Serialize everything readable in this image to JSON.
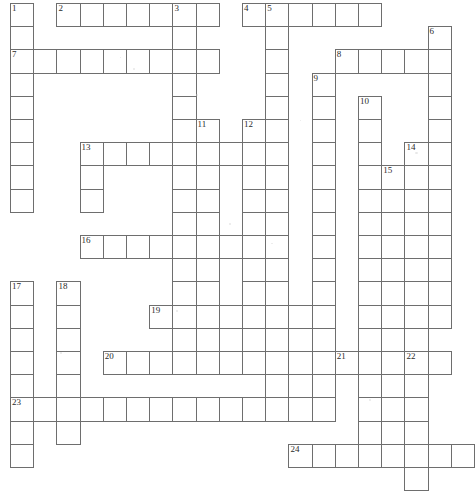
{
  "puzzle": {
    "kind": "crossword-grid",
    "title": "",
    "grid": {
      "origin_x": 10,
      "origin_y": 3,
      "cell_size": 23.2,
      "columns": 19,
      "rows": 20,
      "line_color": "#6e6e6e",
      "cell_color": "#ffffff",
      "number_color": "#2b2b2b"
    },
    "entries": [
      {
        "number": "1",
        "direction": "down",
        "col": 0,
        "row": 0,
        "length": 9
      },
      {
        "number": "2",
        "direction": "across",
        "col": 2,
        "row": 0,
        "length": 7
      },
      {
        "number": "3",
        "direction": "down",
        "col": 7,
        "row": 0,
        "length": 16
      },
      {
        "number": "4",
        "direction": "across",
        "col": 10,
        "row": 0,
        "length": 6
      },
      {
        "number": "5",
        "direction": "down",
        "col": 11,
        "row": 0,
        "length": 18
      },
      {
        "number": "6",
        "direction": "down",
        "col": 18,
        "row": 1,
        "length": 13
      },
      {
        "number": "7",
        "direction": "across",
        "col": 0,
        "row": 2,
        "length": 9
      },
      {
        "number": "8",
        "direction": "across",
        "col": 14,
        "row": 2,
        "length": 5
      },
      {
        "number": "9",
        "direction": "down",
        "col": 13,
        "row": 3,
        "length": 15
      },
      {
        "number": "10",
        "direction": "down",
        "col": 15,
        "row": 4,
        "length": 15
      },
      {
        "number": "11",
        "direction": "down",
        "col": 8,
        "row": 5,
        "length": 10
      },
      {
        "number": "12",
        "direction": "down",
        "col": 10,
        "row": 5,
        "length": 10
      },
      {
        "number": "13",
        "direction": "across",
        "col": 3,
        "row": 6,
        "length": 7
      },
      {
        "number": "14",
        "direction": "down",
        "col": 17,
        "row": 6,
        "length": 10
      },
      {
        "number": "15",
        "direction": "down",
        "col": 16,
        "row": 7,
        "length": 11
      },
      {
        "number": "16",
        "direction": "across",
        "col": 3,
        "row": 10,
        "length": 7
      },
      {
        "number": "17",
        "direction": "down",
        "col": 0,
        "row": 12,
        "length": 8
      },
      {
        "number": "18",
        "direction": "down",
        "col": 2,
        "row": 12,
        "length": 7
      },
      {
        "number": "19",
        "direction": "across",
        "col": 6,
        "row": 13,
        "length": 7
      },
      {
        "number": "20",
        "direction": "across",
        "col": 4,
        "row": 15,
        "length": 10
      },
      {
        "number": "21",
        "direction": "across",
        "col": 14,
        "row": 15,
        "length": 5
      },
      {
        "number": "22",
        "direction": "down",
        "col": 17,
        "row": 15,
        "length": 5
      },
      {
        "number": "23",
        "direction": "across",
        "col": 0,
        "row": 17,
        "length": 13
      },
      {
        "number": "24",
        "direction": "across",
        "col": 12,
        "row": 19,
        "length": 8
      }
    ],
    "cells": [
      {
        "col": 0,
        "row": 0,
        "num": "1"
      },
      {
        "col": 0,
        "row": 1,
        "num": ""
      },
      {
        "col": 0,
        "row": 2,
        "num": "7"
      },
      {
        "col": 0,
        "row": 3,
        "num": ""
      },
      {
        "col": 0,
        "row": 4,
        "num": ""
      },
      {
        "col": 0,
        "row": 5,
        "num": ""
      },
      {
        "col": 0,
        "row": 6,
        "num": ""
      },
      {
        "col": 0,
        "row": 7,
        "num": ""
      },
      {
        "col": 0,
        "row": 8,
        "num": ""
      },
      {
        "col": 1,
        "row": 2,
        "num": ""
      },
      {
        "col": 2,
        "row": 2,
        "num": ""
      },
      {
        "col": 3,
        "row": 2,
        "num": ""
      },
      {
        "col": 4,
        "row": 2,
        "num": ""
      },
      {
        "col": 5,
        "row": 2,
        "num": ""
      },
      {
        "col": 6,
        "row": 2,
        "num": ""
      },
      {
        "col": 7,
        "row": 2,
        "num": ""
      },
      {
        "col": 8,
        "row": 2,
        "num": ""
      },
      {
        "col": 2,
        "row": 0,
        "num": "2"
      },
      {
        "col": 3,
        "row": 0,
        "num": ""
      },
      {
        "col": 4,
        "row": 0,
        "num": ""
      },
      {
        "col": 5,
        "row": 0,
        "num": ""
      },
      {
        "col": 6,
        "row": 0,
        "num": ""
      },
      {
        "col": 7,
        "row": 0,
        "num": "3"
      },
      {
        "col": 8,
        "row": 0,
        "num": ""
      },
      {
        "col": 7,
        "row": 1,
        "num": ""
      },
      {
        "col": 7,
        "row": 3,
        "num": ""
      },
      {
        "col": 7,
        "row": 4,
        "num": ""
      },
      {
        "col": 7,
        "row": 5,
        "num": ""
      },
      {
        "col": 7,
        "row": 6,
        "num": ""
      },
      {
        "col": 7,
        "row": 7,
        "num": ""
      },
      {
        "col": 7,
        "row": 8,
        "num": ""
      },
      {
        "col": 7,
        "row": 9,
        "num": ""
      },
      {
        "col": 7,
        "row": 10,
        "num": ""
      },
      {
        "col": 7,
        "row": 11,
        "num": ""
      },
      {
        "col": 7,
        "row": 12,
        "num": ""
      },
      {
        "col": 7,
        "row": 13,
        "num": ""
      },
      {
        "col": 7,
        "row": 14,
        "num": ""
      },
      {
        "col": 7,
        "row": 15,
        "num": ""
      },
      {
        "col": 10,
        "row": 0,
        "num": "4"
      },
      {
        "col": 11,
        "row": 0,
        "num": "5"
      },
      {
        "col": 12,
        "row": 0,
        "num": ""
      },
      {
        "col": 13,
        "row": 0,
        "num": ""
      },
      {
        "col": 14,
        "row": 0,
        "num": ""
      },
      {
        "col": 15,
        "row": 0,
        "num": ""
      },
      {
        "col": 11,
        "row": 1,
        "num": ""
      },
      {
        "col": 11,
        "row": 2,
        "num": ""
      },
      {
        "col": 11,
        "row": 3,
        "num": ""
      },
      {
        "col": 11,
        "row": 4,
        "num": ""
      },
      {
        "col": 11,
        "row": 5,
        "num": ""
      },
      {
        "col": 11,
        "row": 6,
        "num": ""
      },
      {
        "col": 11,
        "row": 7,
        "num": ""
      },
      {
        "col": 11,
        "row": 8,
        "num": ""
      },
      {
        "col": 11,
        "row": 9,
        "num": ""
      },
      {
        "col": 11,
        "row": 10,
        "num": ""
      },
      {
        "col": 11,
        "row": 11,
        "num": ""
      },
      {
        "col": 11,
        "row": 12,
        "num": ""
      },
      {
        "col": 11,
        "row": 13,
        "num": ""
      },
      {
        "col": 11,
        "row": 14,
        "num": ""
      },
      {
        "col": 11,
        "row": 15,
        "num": ""
      },
      {
        "col": 11,
        "row": 16,
        "num": ""
      },
      {
        "col": 11,
        "row": 17,
        "num": ""
      },
      {
        "col": 18,
        "row": 1,
        "num": "6"
      },
      {
        "col": 18,
        "row": 2,
        "num": ""
      },
      {
        "col": 18,
        "row": 3,
        "num": ""
      },
      {
        "col": 18,
        "row": 4,
        "num": ""
      },
      {
        "col": 18,
        "row": 5,
        "num": ""
      },
      {
        "col": 18,
        "row": 6,
        "num": ""
      },
      {
        "col": 18,
        "row": 7,
        "num": ""
      },
      {
        "col": 18,
        "row": 8,
        "num": ""
      },
      {
        "col": 18,
        "row": 9,
        "num": ""
      },
      {
        "col": 18,
        "row": 10,
        "num": ""
      },
      {
        "col": 18,
        "row": 11,
        "num": ""
      },
      {
        "col": 18,
        "row": 12,
        "num": ""
      },
      {
        "col": 14,
        "row": 2,
        "num": "8"
      },
      {
        "col": 15,
        "row": 2,
        "num": ""
      },
      {
        "col": 16,
        "row": 2,
        "num": ""
      },
      {
        "col": 17,
        "row": 2,
        "num": ""
      },
      {
        "col": 13,
        "row": 3,
        "num": "9"
      },
      {
        "col": 13,
        "row": 4,
        "num": ""
      },
      {
        "col": 13,
        "row": 5,
        "num": ""
      },
      {
        "col": 13,
        "row": 6,
        "num": ""
      },
      {
        "col": 13,
        "row": 7,
        "num": ""
      },
      {
        "col": 13,
        "row": 8,
        "num": ""
      },
      {
        "col": 13,
        "row": 9,
        "num": ""
      },
      {
        "col": 13,
        "row": 10,
        "num": ""
      },
      {
        "col": 13,
        "row": 11,
        "num": ""
      },
      {
        "col": 13,
        "row": 12,
        "num": ""
      },
      {
        "col": 13,
        "row": 13,
        "num": ""
      },
      {
        "col": 13,
        "row": 14,
        "num": ""
      },
      {
        "col": 13,
        "row": 15,
        "num": ""
      },
      {
        "col": 13,
        "row": 16,
        "num": ""
      },
      {
        "col": 13,
        "row": 17,
        "num": ""
      },
      {
        "col": 15,
        "row": 4,
        "num": "10"
      },
      {
        "col": 15,
        "row": 5,
        "num": ""
      },
      {
        "col": 15,
        "row": 6,
        "num": ""
      },
      {
        "col": 15,
        "row": 7,
        "num": ""
      },
      {
        "col": 15,
        "row": 8,
        "num": ""
      },
      {
        "col": 15,
        "row": 9,
        "num": ""
      },
      {
        "col": 15,
        "row": 10,
        "num": ""
      },
      {
        "col": 15,
        "row": 11,
        "num": ""
      },
      {
        "col": 15,
        "row": 12,
        "num": ""
      },
      {
        "col": 15,
        "row": 13,
        "num": ""
      },
      {
        "col": 15,
        "row": 14,
        "num": ""
      },
      {
        "col": 15,
        "row": 15,
        "num": ""
      },
      {
        "col": 15,
        "row": 16,
        "num": ""
      },
      {
        "col": 15,
        "row": 17,
        "num": ""
      },
      {
        "col": 15,
        "row": 18,
        "num": ""
      },
      {
        "col": 8,
        "row": 5,
        "num": "11"
      },
      {
        "col": 8,
        "row": 6,
        "num": ""
      },
      {
        "col": 8,
        "row": 7,
        "num": ""
      },
      {
        "col": 8,
        "row": 8,
        "num": ""
      },
      {
        "col": 8,
        "row": 9,
        "num": ""
      },
      {
        "col": 8,
        "row": 10,
        "num": ""
      },
      {
        "col": 8,
        "row": 11,
        "num": ""
      },
      {
        "col": 8,
        "row": 12,
        "num": ""
      },
      {
        "col": 8,
        "row": 13,
        "num": ""
      },
      {
        "col": 8,
        "row": 14,
        "num": ""
      },
      {
        "col": 10,
        "row": 5,
        "num": "12"
      },
      {
        "col": 10,
        "row": 6,
        "num": ""
      },
      {
        "col": 10,
        "row": 7,
        "num": ""
      },
      {
        "col": 10,
        "row": 8,
        "num": ""
      },
      {
        "col": 10,
        "row": 9,
        "num": ""
      },
      {
        "col": 10,
        "row": 10,
        "num": ""
      },
      {
        "col": 10,
        "row": 11,
        "num": ""
      },
      {
        "col": 10,
        "row": 12,
        "num": ""
      },
      {
        "col": 10,
        "row": 13,
        "num": ""
      },
      {
        "col": 3,
        "row": 6,
        "num": "13"
      },
      {
        "col": 4,
        "row": 6,
        "num": ""
      },
      {
        "col": 5,
        "row": 6,
        "num": ""
      },
      {
        "col": 6,
        "row": 6,
        "num": ""
      },
      {
        "col": 9,
        "row": 6,
        "num": ""
      },
      {
        "col": 3,
        "row": 7,
        "num": ""
      },
      {
        "col": 3,
        "row": 8,
        "num": ""
      },
      {
        "col": 17,
        "row": 6,
        "num": "14"
      },
      {
        "col": 17,
        "row": 7,
        "num": ""
      },
      {
        "col": 17,
        "row": 8,
        "num": ""
      },
      {
        "col": 17,
        "row": 9,
        "num": ""
      },
      {
        "col": 17,
        "row": 10,
        "num": ""
      },
      {
        "col": 17,
        "row": 11,
        "num": ""
      },
      {
        "col": 17,
        "row": 12,
        "num": ""
      },
      {
        "col": 17,
        "row": 13,
        "num": ""
      },
      {
        "col": 16,
        "row": 7,
        "num": "15"
      },
      {
        "col": 16,
        "row": 8,
        "num": ""
      },
      {
        "col": 16,
        "row": 9,
        "num": ""
      },
      {
        "col": 16,
        "row": 10,
        "num": ""
      },
      {
        "col": 16,
        "row": 11,
        "num": ""
      },
      {
        "col": 16,
        "row": 12,
        "num": ""
      },
      {
        "col": 16,
        "row": 13,
        "num": ""
      },
      {
        "col": 3,
        "row": 10,
        "num": "16"
      },
      {
        "col": 4,
        "row": 10,
        "num": ""
      },
      {
        "col": 5,
        "row": 10,
        "num": ""
      },
      {
        "col": 6,
        "row": 10,
        "num": ""
      },
      {
        "col": 9,
        "row": 10,
        "num": ""
      },
      {
        "col": 0,
        "row": 12,
        "num": "17"
      },
      {
        "col": 0,
        "row": 13,
        "num": ""
      },
      {
        "col": 0,
        "row": 14,
        "num": ""
      },
      {
        "col": 0,
        "row": 15,
        "num": ""
      },
      {
        "col": 0,
        "row": 16,
        "num": ""
      },
      {
        "col": 0,
        "row": 17,
        "num": "23"
      },
      {
        "col": 0,
        "row": 18,
        "num": ""
      },
      {
        "col": 0,
        "row": 19,
        "num": ""
      },
      {
        "col": 2,
        "row": 12,
        "num": "18"
      },
      {
        "col": 2,
        "row": 13,
        "num": ""
      },
      {
        "col": 2,
        "row": 14,
        "num": ""
      },
      {
        "col": 2,
        "row": 15,
        "num": ""
      },
      {
        "col": 2,
        "row": 16,
        "num": ""
      },
      {
        "col": 2,
        "row": 17,
        "num": ""
      },
      {
        "col": 2,
        "row": 18,
        "num": ""
      },
      {
        "col": 6,
        "row": 13,
        "num": "19"
      },
      {
        "col": 9,
        "row": 13,
        "num": ""
      },
      {
        "col": 12,
        "row": 13,
        "num": ""
      },
      {
        "col": 4,
        "row": 15,
        "num": "20"
      },
      {
        "col": 5,
        "row": 15,
        "num": ""
      },
      {
        "col": 6,
        "row": 15,
        "num": ""
      },
      {
        "col": 9,
        "row": 15,
        "num": ""
      },
      {
        "col": 10,
        "row": 15,
        "num": ""
      },
      {
        "col": 12,
        "row": 15,
        "num": ""
      },
      {
        "col": 14,
        "row": 15,
        "num": "21"
      },
      {
        "col": 17,
        "row": 15,
        "num": "22"
      },
      {
        "col": 18,
        "row": 15,
        "num": ""
      },
      {
        "col": 1,
        "row": 17,
        "num": ""
      },
      {
        "col": 3,
        "row": 17,
        "num": ""
      },
      {
        "col": 4,
        "row": 17,
        "num": ""
      },
      {
        "col": 5,
        "row": 17,
        "num": ""
      },
      {
        "col": 6,
        "row": 17,
        "num": ""
      },
      {
        "col": 8,
        "row": 17,
        "num": ""
      },
      {
        "col": 9,
        "row": 17,
        "num": ""
      },
      {
        "col": 10,
        "row": 17,
        "num": ""
      },
      {
        "col": 12,
        "row": 17,
        "num": ""
      },
      {
        "col": 12,
        "row": 19,
        "num": "24"
      },
      {
        "col": 14,
        "row": 19,
        "num": ""
      },
      {
        "col": 16,
        "row": 19,
        "num": ""
      },
      {
        "col": 17,
        "row": 19,
        "num": ""
      },
      {
        "col": 18,
        "row": 19,
        "num": ""
      },
      {
        "col": 17,
        "row": 16,
        "num": ""
      },
      {
        "col": 17,
        "row": 17,
        "num": ""
      },
      {
        "col": 17,
        "row": 18,
        "num": ""
      },
      {
        "col": 17,
        "row": 20,
        "num": ""
      }
    ]
  }
}
